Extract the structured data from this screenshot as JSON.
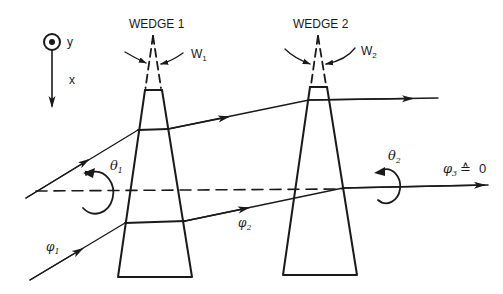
{
  "diagram": {
    "coordinate_system": {
      "y_label": "y",
      "x_label": "x"
    },
    "wedge1": {
      "title": "WEDGE 1",
      "angle_label": "W",
      "angle_subscript": "1",
      "rotation_label": "θ",
      "rotation_subscript": "1"
    },
    "wedge2": {
      "title": "WEDGE 2",
      "angle_label": "W",
      "angle_subscript": "2",
      "rotation_label": "θ",
      "rotation_subscript": "2"
    },
    "rays": {
      "input_angle_label": "φ",
      "input_angle_subscript": "1",
      "intermediate_angle_label": "φ",
      "intermediate_angle_subscript": "2",
      "output_angle_label": "φ",
      "output_angle_subscript": "3",
      "output_relation": "≙",
      "output_value": "0"
    },
    "colors": {
      "ink": "#1a1a1a",
      "background": "#ffffff"
    }
  }
}
